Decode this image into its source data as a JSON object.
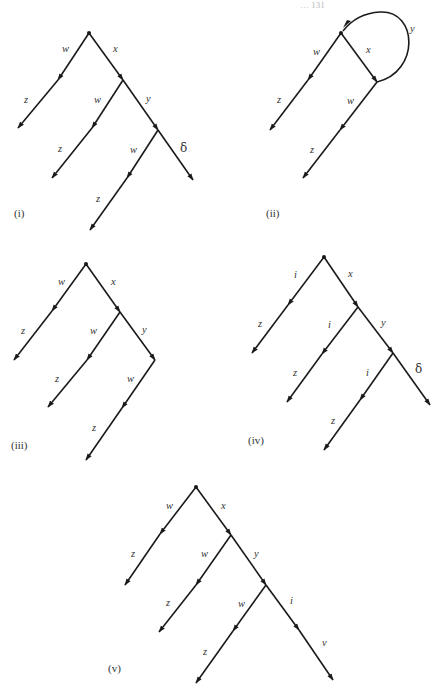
{
  "page": {
    "running_header": "… 131",
    "background": "#ffffff",
    "ink_color": "#1a1a1a"
  },
  "diagrams": [
    {
      "id": "i",
      "caption": "(i)",
      "caption_pos": [
        14,
        217
      ],
      "root": [
        89,
        33
      ],
      "edges": [
        {
          "from": [
            89,
            33
          ],
          "to": [
            58,
            80
          ],
          "label": "w",
          "label_pos": [
            62,
            52
          ],
          "head": "end"
        },
        {
          "from": [
            58,
            80
          ],
          "to": [
            18,
            128
          ],
          "label": "z",
          "label_pos": [
            24,
            103
          ],
          "head": "end"
        },
        {
          "from": [
            89,
            33
          ],
          "to": [
            123,
            80
          ],
          "label": "x",
          "label_pos": [
            113,
            52
          ],
          "head": "end"
        },
        {
          "from": [
            123,
            80
          ],
          "to": [
            92,
            128
          ],
          "label": "w",
          "label_pos": [
            94,
            103
          ],
          "head": "end"
        },
        {
          "from": [
            92,
            128
          ],
          "to": [
            52,
            178
          ],
          "label": "z",
          "label_pos": [
            58,
            152
          ],
          "head": "end"
        },
        {
          "from": [
            123,
            80
          ],
          "to": [
            158,
            130
          ],
          "label": "y",
          "label_pos": [
            146,
            102
          ],
          "head": "end"
        },
        {
          "from": [
            158,
            130
          ],
          "to": [
            127,
            178
          ],
          "label": "w",
          "label_pos": [
            130,
            153
          ],
          "head": "end"
        },
        {
          "from": [
            127,
            178
          ],
          "to": [
            90,
            230
          ],
          "label": "z",
          "label_pos": [
            96,
            202
          ],
          "head": "end"
        },
        {
          "from": [
            158,
            130
          ],
          "to": [
            193,
            180
          ],
          "label": "δ",
          "label_pos": [
            180,
            152
          ],
          "head": "end",
          "greek": true
        }
      ]
    },
    {
      "id": "ii",
      "caption": "(ii)",
      "caption_pos": [
        266,
        217
      ],
      "root": [
        341,
        33
      ],
      "edges": [
        {
          "from": [
            341,
            33
          ],
          "to": [
            308,
            80
          ],
          "label": "w",
          "label_pos": [
            313,
            55
          ],
          "head": "end"
        },
        {
          "from": [
            308,
            80
          ],
          "to": [
            270,
            130
          ],
          "label": "z",
          "label_pos": [
            277,
            103
          ],
          "head": "end"
        },
        {
          "from": [
            341,
            33
          ],
          "to": [
            377,
            82
          ],
          "label": "x",
          "label_pos": [
            366,
            53
          ],
          "head": "end"
        },
        {
          "from": [
            377,
            82
          ],
          "to": [
            340,
            130
          ],
          "label": "w",
          "label_pos": [
            347,
            104
          ],
          "head": "end"
        },
        {
          "from": [
            340,
            130
          ],
          "to": [
            303,
            178
          ],
          "label": "z",
          "label_pos": [
            310,
            153
          ],
          "head": "end"
        }
      ],
      "arcs": [
        {
          "path": "M377,82 C420,72 418,10 380,12 C362,13 350,22 343,31",
          "label": "y",
          "label_pos": [
            410,
            32
          ],
          "head_at": [
            345,
            29
          ]
        }
      ]
    },
    {
      "id": "iii",
      "caption": "(iii)",
      "caption_pos": [
        11,
        449
      ],
      "root": [
        86,
        264
      ],
      "edges": [
        {
          "from": [
            86,
            264
          ],
          "to": [
            52,
            311
          ],
          "label": "w",
          "label_pos": [
            58,
            285
          ],
          "head": "end"
        },
        {
          "from": [
            52,
            311
          ],
          "to": [
            14,
            360
          ],
          "label": "z",
          "label_pos": [
            21,
            334
          ],
          "head": "end"
        },
        {
          "from": [
            86,
            264
          ],
          "to": [
            120,
            312
          ],
          "label": "x",
          "label_pos": [
            111,
            285
          ],
          "head": "end"
        },
        {
          "from": [
            120,
            312
          ],
          "to": [
            87,
            360
          ],
          "label": "w",
          "label_pos": [
            90,
            334
          ],
          "head": "end"
        },
        {
          "from": [
            87,
            360
          ],
          "to": [
            48,
            407
          ],
          "label": "z",
          "label_pos": [
            55,
            382
          ],
          "head": "end"
        },
        {
          "from": [
            120,
            312
          ],
          "to": [
            155,
            360
          ],
          "label": "y",
          "label_pos": [
            142,
            333
          ],
          "head": "end"
        },
        {
          "from": [
            155,
            360
          ],
          "to": [
            122,
            408
          ],
          "label": "w",
          "label_pos": [
            127,
            382
          ],
          "head": "end"
        },
        {
          "from": [
            122,
            408
          ],
          "to": [
            86,
            460
          ],
          "label": "z",
          "label_pos": [
            92,
            431
          ],
          "head": "end"
        }
      ]
    },
    {
      "id": "iv",
      "caption": "(iv)",
      "caption_pos": [
        248,
        444
      ],
      "root": [
        324,
        257
      ],
      "edges": [
        {
          "from": [
            324,
            257
          ],
          "to": [
            288,
            305
          ],
          "label": "i",
          "label_pos": [
            294,
            278
          ],
          "head": "end"
        },
        {
          "from": [
            288,
            305
          ],
          "to": [
            252,
            353
          ],
          "label": "z",
          "label_pos": [
            258,
            327
          ],
          "head": "end"
        },
        {
          "from": [
            324,
            257
          ],
          "to": [
            358,
            307
          ],
          "label": "x",
          "label_pos": [
            348,
            277
          ],
          "head": "end"
        },
        {
          "from": [
            358,
            307
          ],
          "to": [
            322,
            354
          ],
          "label": "i",
          "label_pos": [
            328,
            328
          ],
          "head": "end"
        },
        {
          "from": [
            322,
            354
          ],
          "to": [
            287,
            402
          ],
          "label": "z",
          "label_pos": [
            293,
            376
          ],
          "head": "end"
        },
        {
          "from": [
            358,
            307
          ],
          "to": [
            393,
            353
          ],
          "label": "y",
          "label_pos": [
            381,
            326
          ],
          "head": "end"
        },
        {
          "from": [
            393,
            353
          ],
          "to": [
            360,
            400
          ],
          "label": "i",
          "label_pos": [
            366,
            376
          ],
          "head": "end"
        },
        {
          "from": [
            360,
            400
          ],
          "to": [
            324,
            450
          ],
          "label": "z",
          "label_pos": [
            331,
            424
          ],
          "head": "end"
        },
        {
          "from": [
            393,
            353
          ],
          "to": [
            430,
            405
          ],
          "label": "δ",
          "label_pos": [
            415,
            373
          ],
          "head": "end",
          "greek": true
        }
      ]
    },
    {
      "id": "v",
      "caption": "(v)",
      "caption_pos": [
        108,
        672
      ],
      "root": [
        196,
        487
      ],
      "edges": [
        {
          "from": [
            196,
            487
          ],
          "to": [
            160,
            534
          ],
          "label": "w",
          "label_pos": [
            166,
            509
          ],
          "head": "end"
        },
        {
          "from": [
            160,
            534
          ],
          "to": [
            125,
            585
          ],
          "label": "z",
          "label_pos": [
            131,
            557
          ],
          "head": "end"
        },
        {
          "from": [
            196,
            487
          ],
          "to": [
            231,
            535
          ],
          "label": "x",
          "label_pos": [
            221,
            509
          ],
          "head": "end"
        },
        {
          "from": [
            231,
            535
          ],
          "to": [
            196,
            585
          ],
          "label": "w",
          "label_pos": [
            201,
            557
          ],
          "head": "end"
        },
        {
          "from": [
            196,
            585
          ],
          "to": [
            159,
            632
          ],
          "label": "z",
          "label_pos": [
            166,
            606
          ],
          "head": "end"
        },
        {
          "from": [
            231,
            535
          ],
          "to": [
            266,
            585
          ],
          "label": "y",
          "label_pos": [
            254,
            557
          ],
          "head": "end"
        },
        {
          "from": [
            266,
            585
          ],
          "to": [
            233,
            631
          ],
          "label": "w",
          "label_pos": [
            238,
            607
          ],
          "head": "end"
        },
        {
          "from": [
            233,
            631
          ],
          "to": [
            196,
            683
          ],
          "label": "z",
          "label_pos": [
            203,
            655
          ],
          "head": "end"
        },
        {
          "from": [
            266,
            585
          ],
          "to": [
            299,
            630
          ],
          "label": "i",
          "label_pos": [
            290,
            604
          ],
          "head": "end"
        },
        {
          "from": [
            299,
            630
          ],
          "to": [
            333,
            680
          ],
          "label": "v",
          "label_pos": [
            322,
            646
          ],
          "head": "end"
        }
      ]
    }
  ]
}
